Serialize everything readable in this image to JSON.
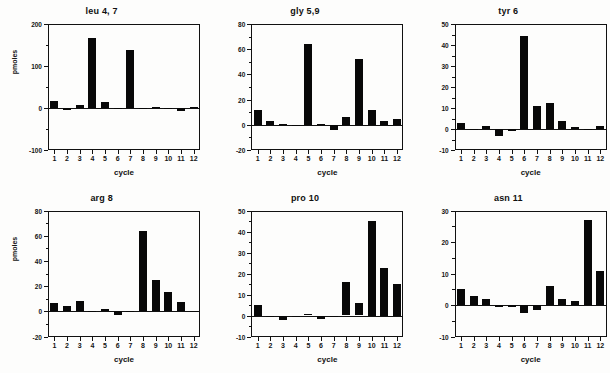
{
  "figure": {
    "background_color": "#fdfdfc",
    "bar_color": "#080808",
    "axis_color": "#111111",
    "layout": "2 rows x 3 columns of bar charts"
  },
  "chart_data": [
    {
      "type": "bar",
      "title": "leu 4, 7",
      "xlabel": "cycle",
      "ylabel": "pmoles",
      "categories": [
        "1",
        "2",
        "3",
        "4",
        "5",
        "6",
        "7",
        "8",
        "9",
        "10",
        "11",
        "12"
      ],
      "values": [
        16,
        -5,
        6,
        167,
        14,
        0,
        138,
        0,
        2,
        0,
        -8,
        3
      ],
      "ylim": [
        -100,
        200
      ],
      "yticks": [
        -100,
        0,
        100,
        200
      ],
      "yminor_step": 50,
      "grid": false,
      "legend": "none"
    },
    {
      "type": "bar",
      "title": "gly 5,9",
      "xlabel": "cycle",
      "ylabel": "",
      "categories": [
        "1",
        "2",
        "3",
        "4",
        "5",
        "6",
        "7",
        "8",
        "9",
        "10",
        "11",
        "12"
      ],
      "values": [
        12,
        3,
        1,
        0,
        64,
        1,
        -4,
        6,
        52,
        12,
        3,
        5
      ],
      "ylim": [
        -20,
        80
      ],
      "yticks": [
        -20,
        0,
        20,
        40,
        60,
        80
      ],
      "yminor_step": 10,
      "grid": false,
      "legend": "none"
    },
    {
      "type": "bar",
      "title": "tyr 6",
      "xlabel": "cycle",
      "ylabel": "",
      "categories": [
        "1",
        "2",
        "3",
        "4",
        "5",
        "6",
        "7",
        "8",
        "9",
        "10",
        "11",
        "12"
      ],
      "values": [
        3,
        0,
        1.5,
        -3.5,
        -1,
        44.5,
        11,
        12.5,
        4,
        1,
        0,
        1.5
      ],
      "ylim": [
        -10,
        50
      ],
      "yticks": [
        -10,
        0,
        10,
        20,
        30,
        40,
        50
      ],
      "yminor_step": 5,
      "grid": false,
      "legend": "none"
    },
    {
      "type": "bar",
      "title": "arg 8",
      "xlabel": "cycle",
      "ylabel": "pmoles",
      "categories": [
        "1",
        "2",
        "3",
        "4",
        "5",
        "6",
        "7",
        "8",
        "9",
        "10",
        "11",
        "12"
      ],
      "values": [
        6.5,
        4,
        8,
        0.5,
        1.5,
        -3,
        0,
        64,
        25,
        15.5,
        7,
        0
      ],
      "ylim": [
        -20,
        80
      ],
      "yticks": [
        -20,
        0,
        20,
        40,
        60,
        80
      ],
      "yminor_step": 10,
      "grid": false,
      "legend": "none"
    },
    {
      "type": "bar",
      "title": "pro 10",
      "xlabel": "cycle",
      "ylabel": "",
      "categories": [
        "1",
        "2",
        "3",
        "4",
        "5",
        "6",
        "7",
        "8",
        "9",
        "10",
        "11",
        "12"
      ],
      "values": [
        5,
        -0.5,
        -2,
        -0.7,
        0.8,
        -1.5,
        -0.3,
        16,
        6,
        45,
        22.5,
        15
      ],
      "ylim": [
        -10,
        50
      ],
      "yticks": [
        -10,
        0,
        10,
        20,
        30,
        40,
        50
      ],
      "yminor_step": 5,
      "grid": false,
      "legend": "none"
    },
    {
      "type": "bar",
      "title": "asn 11",
      "xlabel": "cycle",
      "ylabel": "",
      "categories": [
        "1",
        "2",
        "3",
        "4",
        "5",
        "6",
        "7",
        "8",
        "9",
        "10",
        "11",
        "12"
      ],
      "values": [
        5,
        3,
        2,
        -0.5,
        -0.5,
        -2.5,
        -1.5,
        6,
        2,
        1.2,
        27,
        10.7
      ],
      "ylim": [
        -10,
        30
      ],
      "yticks": [
        -10,
        0,
        10,
        20,
        30
      ],
      "yminor_step": 5,
      "grid": false,
      "legend": "none"
    }
  ]
}
